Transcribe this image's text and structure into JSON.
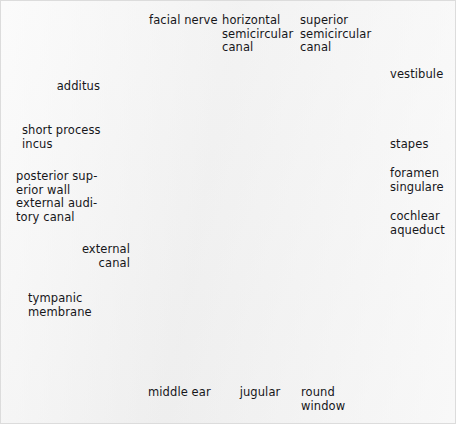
{
  "figure": {
    "kind": "anatomical-specimen-photograph",
    "background_color": "#f1f1f1",
    "ink_color": "#16161a",
    "leader_line_color": "#3a3a3e",
    "specimen_tone_light": "#cfcfcf",
    "specimen_tone_mid": "#8e8e8e",
    "specimen_tone_dark": "#1b1b1b"
  },
  "labels": [
    {
      "id": "facial-nerve",
      "text": "facial nerve",
      "align": "center",
      "x": 149,
      "y": 14,
      "w": 68
    },
    {
      "id": "horizontal-scc",
      "text": "horizontal\nsemicircular\ncanal",
      "align": "left",
      "x": 222,
      "y": 14,
      "w": 74
    },
    {
      "id": "superior-scc",
      "text": "superior\nsemicircular\ncanal",
      "align": "left",
      "x": 300,
      "y": 14,
      "w": 74
    },
    {
      "id": "vestibule",
      "text": "vestibule",
      "align": "left",
      "x": 390,
      "y": 68,
      "w": 62
    },
    {
      "id": "additus",
      "text": "additus",
      "align": "right",
      "x": 44,
      "y": 80,
      "w": 56
    },
    {
      "id": "stapes",
      "text": "stapes",
      "align": "left",
      "x": 390,
      "y": 138,
      "w": 62
    },
    {
      "id": "short-process-incus",
      "text": "short process\nincus",
      "align": "left",
      "x": 22,
      "y": 124,
      "w": 80
    },
    {
      "id": "foramen-singulare",
      "text": "foramen\nsingulare",
      "align": "left",
      "x": 390,
      "y": 167,
      "w": 64
    },
    {
      "id": "posterior-wall-eac",
      "text": "posterior sup-\nerior wall\nexternal audi-\ntory canal",
      "align": "left",
      "x": 16,
      "y": 170,
      "w": 96
    },
    {
      "id": "cochlear-aqueduct",
      "text": "cochlear\naqueduct",
      "align": "left",
      "x": 390,
      "y": 210,
      "w": 64
    },
    {
      "id": "external-canal",
      "text": "external\ncanal",
      "align": "right",
      "x": 46,
      "y": 243,
      "w": 84
    },
    {
      "id": "tympanic-membrane",
      "text": "tympanic\nmembrane",
      "align": "left",
      "x": 28,
      "y": 292,
      "w": 82
    },
    {
      "id": "middle-ear",
      "text": "middle ear",
      "align": "center",
      "x": 148,
      "y": 386,
      "w": 58
    },
    {
      "id": "jugular",
      "text": "jugular",
      "align": "center",
      "x": 238,
      "y": 386,
      "w": 44
    },
    {
      "id": "round-window",
      "text": "round\nwindow",
      "align": "left",
      "x": 301,
      "y": 386,
      "w": 50
    }
  ],
  "leader_lines": [
    {
      "id": "leader-facial-nerve",
      "points": "174,31 174,60 225,137"
    },
    {
      "id": "leader-horizontal-scc",
      "points": "250,57 250,100"
    },
    {
      "id": "leader-superior-scc",
      "points": "330,57 330,80 262,165"
    },
    {
      "id": "leader-vestibule",
      "points": "386,72 330,72 300,88"
    },
    {
      "id": "leader-additus",
      "points": "104,86 182,86 204,131"
    },
    {
      "id": "leader-stapes",
      "points": "386,142 335,142 284,157"
    },
    {
      "id": "leader-short-process-incus",
      "points": "106,131 182,131 206,148"
    },
    {
      "id": "leader-foramen-singulare",
      "points": "386,171 333,171 296,189"
    },
    {
      "id": "leader-posterior-wall-eac",
      "points": "118,176 256,176"
    },
    {
      "id": "leader-cochlear-aqueduct",
      "points": "386,214 312,214 282,200"
    },
    {
      "id": "leader-external-canal",
      "points": "134,247 190,247 288,226"
    },
    {
      "id": "leader-tympanic-membrane",
      "points": "118,296 160,296 292,228"
    },
    {
      "id": "leader-middle-ear",
      "points": "177,381 177,337"
    },
    {
      "id": "leader-jugular",
      "points": "260,381 260,305"
    },
    {
      "id": "leader-round-window",
      "points": "318,381 318,352 265,262"
    }
  ]
}
